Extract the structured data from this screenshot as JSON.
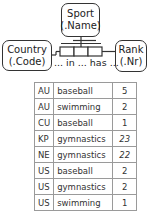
{
  "entities": {
    "sport": {
      "name": "Sport",
      "ref": "(.Name)"
    },
    "country": {
      "name": "Country",
      "ref": "(.Code)"
    },
    "rank": {
      "name": "Rank",
      "ref": "(.Nr)"
    }
  },
  "fact_type": {
    "reading": "... in ... has ...",
    "roles": 3
  },
  "population": {
    "columns": [
      "Country",
      "Sport",
      "Rank"
    ],
    "rows": [
      {
        "country": "AU",
        "sport": "baseball",
        "rank": "5",
        "italic": false
      },
      {
        "country": "AU",
        "sport": "swimming",
        "rank": "2",
        "italic": false
      },
      {
        "country": "CU",
        "sport": "baseball",
        "rank": "1",
        "italic": false
      },
      {
        "country": "KP",
        "sport": "gymnastics",
        "rank": "23",
        "italic": true
      },
      {
        "country": "NE",
        "sport": "gymnastics",
        "rank": "22",
        "italic": true
      },
      {
        "country": "US",
        "sport": "baseball",
        "rank": "2",
        "italic": false
      },
      {
        "country": "US",
        "sport": "gymnastics",
        "rank": "2",
        "italic": false
      },
      {
        "country": "US",
        "sport": "swimming",
        "rank": "1",
        "italic": false
      }
    ]
  },
  "colors": {
    "stroke": "#333333",
    "table_border": "#9a9a9a",
    "background": "#ffffff"
  }
}
